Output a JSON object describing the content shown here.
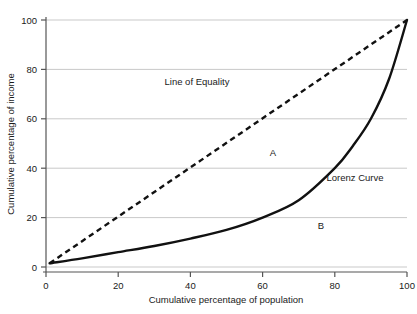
{
  "chart_data": {
    "type": "line",
    "title": "",
    "xlabel": "Cumulative percentage of population",
    "ylabel": "Cumulative percentage of income",
    "xlim": [
      0,
      100
    ],
    "ylim": [
      0,
      100
    ],
    "xticks": [
      0,
      20,
      40,
      60,
      80,
      100
    ],
    "yticks": [
      0,
      20,
      40,
      60,
      80,
      100
    ],
    "xticklabels": [
      "0",
      "20",
      "40",
      "60",
      "80",
      "100"
    ],
    "yticklabels": [
      "0",
      "20",
      "40",
      "60",
      "80",
      "100"
    ],
    "grid": "horizontal",
    "grid_color": "#c9c9c9",
    "legend_position": "inline-annotations",
    "series": [
      {
        "name": "Line of Equality",
        "style": "dashed",
        "color": "#111111",
        "x": [
          1,
          100
        ],
        "values": [
          1.5,
          100
        ]
      },
      {
        "name": "Lorenz Curve",
        "style": "solid",
        "color": "#111111",
        "x": [
          1,
          10,
          20,
          30,
          40,
          50,
          60,
          70,
          80,
          85,
          90,
          95,
          100
        ],
        "values": [
          1.5,
          3.5,
          6,
          8.5,
          11.5,
          15,
          20,
          27,
          40,
          49,
          60,
          76,
          100
        ]
      }
    ],
    "annotations": [
      {
        "text": "Line of Equality",
        "x": 42,
        "y": 72,
        "name": "line-of-equality-label"
      },
      {
        "text": "Lorenz Curve",
        "x": 82,
        "y": 37,
        "name": "lorenz-curve-label"
      },
      {
        "text": "A",
        "x": 63,
        "y": 44,
        "name": "area-a-label"
      },
      {
        "text": "B",
        "x": 76,
        "y": 18,
        "name": "area-b-label"
      }
    ]
  }
}
